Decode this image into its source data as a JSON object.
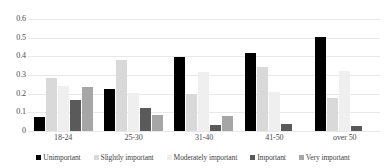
{
  "chart_data": {
    "type": "bar",
    "title": "",
    "subtitle": "",
    "xlabel": "",
    "ylabel": "",
    "ylim": [
      0,
      0.6
    ],
    "ytick_labels": [
      "0.6",
      "0.5",
      "0.4",
      "0.3",
      "0.2",
      "0.1",
      "0"
    ],
    "ytick_values": [
      0.6,
      0.5,
      0.4,
      0.3,
      0.2,
      0.1,
      0
    ],
    "grid": "horizontal",
    "legend_position": "bottom",
    "categories": [
      "18-24",
      "25-30",
      "31-40",
      "41-50",
      "over 50"
    ],
    "series": [
      {
        "name": "Unimportant",
        "color": "#000000",
        "values": [
          0.075,
          0.225,
          0.395,
          0.42,
          0.505
        ]
      },
      {
        "name": "Slightly important",
        "color": "#d9d9d9",
        "values": [
          0.285,
          0.38,
          0.2,
          0.345,
          0.175
        ]
      },
      {
        "name": "Moderately important",
        "color": "#efefef",
        "values": [
          0.24,
          0.205,
          0.315,
          0.21,
          0.32
        ]
      },
      {
        "name": "Important",
        "color": "#5a5a5a",
        "values": [
          0.165,
          0.125,
          0.03,
          0.04,
          0.025
        ]
      },
      {
        "name": "Very important",
        "color": "#a6a6a6",
        "values": [
          0.235,
          0.085,
          0.078,
          0.0,
          0.0
        ]
      }
    ]
  }
}
